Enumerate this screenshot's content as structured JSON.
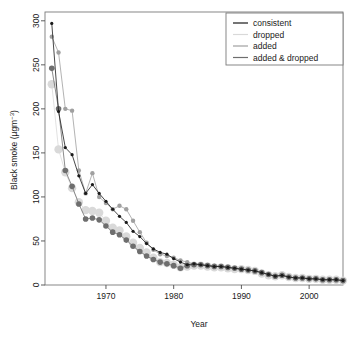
{
  "chart_data": {
    "type": "line",
    "title": "",
    "xlabel": "Year",
    "ylabel": "Black smoke (µgm−3)",
    "ylabel_main": "Black smoke (µgm",
    "ylabel_sup": "−3",
    "ylabel_tail": ")",
    "xlim": [
      1961,
      2005
    ],
    "ylim": [
      0,
      310
    ],
    "xticks": [
      1970,
      1980,
      1990,
      2000
    ],
    "yticks": [
      0,
      50,
      100,
      150,
      200,
      250,
      300
    ],
    "grid": false,
    "legend_position": "top-right",
    "legend": [
      "consistent",
      "dropped",
      "added",
      "added & dropped"
    ],
    "colors": {
      "consistent": "#1a1a1a",
      "dropped": "#d9d9d9",
      "added": "#a0a0a0",
      "added_dropped": "#6e6e6e",
      "axis": "#4d4d4d",
      "frame": "#7a7a7a",
      "text": "#1a1a1a"
    },
    "point_sizes": {
      "consistent": 1.6,
      "dropped": 4.2,
      "added": 2.2,
      "added_dropped": 2.8
    },
    "series": [
      {
        "name": "consistent",
        "x": [
          1962,
          1963,
          1964,
          1965,
          1966,
          1967,
          1968,
          1969,
          1970,
          1971,
          1972,
          1973,
          1974,
          1975,
          1976,
          1977,
          1978,
          1979,
          1980,
          1981,
          1982,
          1983,
          1984,
          1985,
          1986,
          1987,
          1988,
          1989,
          1990,
          1991,
          1992,
          1993,
          1994,
          1995,
          1996,
          1997,
          1998,
          1999,
          2000,
          2001,
          2002,
          2003,
          2004,
          2005
        ],
        "values": [
          297,
          197,
          156,
          148,
          124,
          104,
          114,
          104,
          95,
          86,
          78,
          71,
          61,
          55,
          47,
          41,
          37,
          35,
          30,
          26,
          23,
          24,
          23,
          22,
          21,
          21,
          20,
          19,
          18,
          17,
          16,
          14,
          12,
          10,
          11,
          9,
          8,
          8,
          7,
          7,
          6,
          6,
          6,
          5
        ]
      },
      {
        "name": "dropped",
        "x": [
          1962,
          1963,
          1964,
          1965,
          1966,
          1967,
          1968,
          1969,
          1970,
          1971,
          1972,
          1973,
          1974,
          1975,
          1976,
          1977,
          1978,
          1979,
          1980,
          1981,
          1982,
          1983,
          1984,
          1985,
          1986,
          1987,
          1988,
          1989,
          1990,
          1991,
          1992,
          1993,
          1994,
          1995,
          1996,
          1997,
          1998,
          1999,
          2000,
          2001,
          2002,
          2003,
          2004,
          2005
        ],
        "values": [
          228,
          154,
          128,
          110,
          94,
          85,
          84,
          82,
          73,
          65,
          62,
          55,
          48,
          42,
          37,
          31,
          26,
          25,
          23,
          20,
          21,
          22,
          22,
          21,
          20,
          20,
          19,
          18,
          18,
          17,
          16,
          13,
          11,
          10,
          11,
          9,
          8,
          8,
          7,
          7,
          6,
          6,
          6,
          5
        ]
      },
      {
        "name": "added",
        "x": [
          1962,
          1963,
          1964,
          1965,
          1966,
          1967,
          1968,
          1969,
          1970,
          1971,
          1972,
          1973,
          1974,
          1975,
          1976,
          1977,
          1978,
          1979,
          1980,
          1981,
          1982,
          1983,
          1984,
          1985,
          1986,
          1987,
          1988,
          1989,
          1990,
          1991,
          1992,
          1993,
          1994,
          1995,
          1996,
          1997,
          1998,
          1999,
          2000,
          2001,
          2002,
          2003,
          2004,
          2005
        ],
        "values": [
          282,
          264,
          200,
          198,
          130,
          104,
          127,
          100,
          93,
          86,
          90,
          86,
          73,
          60,
          48,
          40,
          35,
          33,
          31,
          28,
          26,
          24,
          23,
          22,
          22,
          21,
          20,
          19,
          18,
          17,
          16,
          14,
          12,
          10,
          11,
          9,
          8,
          8,
          7,
          7,
          6,
          6,
          6,
          5
        ]
      },
      {
        "name": "added & dropped",
        "x": [
          1962,
          1963,
          1964,
          1965,
          1966,
          1967,
          1968,
          1969,
          1970,
          1971,
          1972,
          1973,
          1974,
          1975,
          1976,
          1977,
          1978,
          1979,
          1980,
          1981,
          1982,
          1983,
          1984,
          1985,
          1986,
          1987,
          1988,
          1989,
          1990,
          1991,
          1992,
          1993,
          1994,
          1995,
          1996,
          1997,
          1998,
          1999,
          2000,
          2001,
          2002,
          2003,
          2004,
          2005
        ],
        "values": [
          246,
          200,
          130,
          112,
          92,
          75,
          76,
          74,
          67,
          60,
          57,
          51,
          44,
          38,
          33,
          29,
          26,
          24,
          22,
          19,
          22,
          23,
          23,
          22,
          21,
          21,
          20,
          19,
          18,
          17,
          16,
          14,
          12,
          10,
          11,
          9,
          8,
          8,
          7,
          7,
          6,
          6,
          6,
          5
        ]
      }
    ]
  },
  "axes": {
    "x_tick_labels": [
      "1970",
      "1980",
      "1990",
      "2000"
    ],
    "y_tick_labels": [
      "0",
      "50",
      "100",
      "150",
      "200",
      "250",
      "300"
    ],
    "x_axis_title": "Year"
  }
}
